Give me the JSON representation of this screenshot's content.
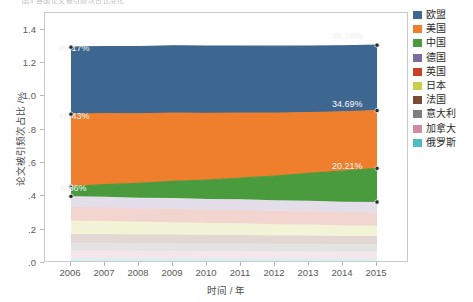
{
  "top_caption": "图3 各国论文被引频次占比变化",
  "axes": {
    "y_title": "论文被引频次占比 /%",
    "x_title": "时间 / 年",
    "y_ticks": [
      ".0",
      ".2",
      ".4",
      ".6",
      ".8",
      "1.0",
      "1.2",
      "1.4"
    ],
    "y_tick_values": [
      0.0,
      0.2,
      0.4,
      0.6,
      0.8,
      1.0,
      1.2,
      1.4
    ],
    "x_ticks": [
      "2006",
      "2007",
      "2008",
      "2009",
      "2010",
      "2011",
      "2012",
      "2013",
      "2014",
      "2015"
    ]
  },
  "legend": {
    "items": [
      {
        "label": "欧盟",
        "color": "#3d6691"
      },
      {
        "label": "美国",
        "color": "#ef7f2c"
      },
      {
        "label": "中国",
        "color": "#4a9b3e"
      },
      {
        "label": "德国",
        "color": "#7e6ba1"
      },
      {
        "label": "英国",
        "color": "#c8422a"
      },
      {
        "label": "日本",
        "color": "#c8cf4a"
      },
      {
        "label": "法国",
        "color": "#7a4a33"
      },
      {
        "label": "意大利",
        "color": "#7f7f7f"
      },
      {
        "label": "加拿大",
        "color": "#cf8ba3"
      },
      {
        "label": "俄罗斯",
        "color": "#4fbcbe"
      }
    ]
  },
  "annotations": [
    {
      "text": "40.17%",
      "series": "欧盟",
      "year": "2006",
      "x_px": 14,
      "y_px": 30
    },
    {
      "text": "39.18%",
      "series": "欧盟",
      "year": "2015",
      "x_px": 287,
      "y_px": 18
    },
    {
      "text": "43.43%",
      "series": "美国",
      "year": "2006",
      "x_px": 14,
      "y_px": 98
    },
    {
      "text": "34.69%",
      "series": "美国",
      "year": "2015",
      "x_px": 287,
      "y_px": 86
    },
    {
      "text": "5.86%",
      "series": "中国",
      "year": "2006",
      "x_px": 16,
      "y_px": 170
    },
    {
      "text": "20.21%",
      "series": "中国",
      "year": "2015",
      "x_px": 287,
      "y_px": 148
    }
  ],
  "chart_data": {
    "type": "area",
    "title": "",
    "xlabel": "时间 / 年",
    "ylabel": "论文被引频次占比 /%",
    "stacked": true,
    "grid": false,
    "legend_position": "right",
    "ylim": [
      0.0,
      1.5
    ],
    "x": [
      2006,
      2007,
      2008,
      2009,
      2010,
      2011,
      2012,
      2013,
      2014,
      2015
    ],
    "categories": [
      "2006",
      "2007",
      "2008",
      "2009",
      "2010",
      "2011",
      "2012",
      "2013",
      "2014",
      "2015"
    ],
    "series": [
      {
        "name": "俄罗斯",
        "color": "#4fbcbe",
        "values": [
          0.03,
          0.03,
          0.029,
          0.029,
          0.028,
          0.028,
          0.027,
          0.027,
          0.026,
          0.026
        ]
      },
      {
        "name": "加拿大",
        "color": "#cf8ba3",
        "values": [
          0.046,
          0.046,
          0.045,
          0.045,
          0.044,
          0.044,
          0.043,
          0.043,
          0.042,
          0.042
        ]
      },
      {
        "name": "意大利",
        "color": "#7f7f7f",
        "values": [
          0.046,
          0.046,
          0.046,
          0.046,
          0.046,
          0.046,
          0.046,
          0.046,
          0.046,
          0.046
        ]
      },
      {
        "name": "法国",
        "color": "#7a4a33",
        "values": [
          0.052,
          0.052,
          0.051,
          0.051,
          0.05,
          0.05,
          0.049,
          0.049,
          0.048,
          0.048
        ]
      },
      {
        "name": "日本",
        "color": "#c8cf4a",
        "values": [
          0.08,
          0.078,
          0.076,
          0.074,
          0.072,
          0.07,
          0.068,
          0.066,
          0.064,
          0.062
        ]
      },
      {
        "name": "英国",
        "color": "#c8422a",
        "values": [
          0.082,
          0.082,
          0.081,
          0.081,
          0.08,
          0.08,
          0.079,
          0.079,
          0.078,
          0.078
        ]
      },
      {
        "name": "德国",
        "color": "#7e6ba1",
        "values": [
          0.064,
          0.064,
          0.064,
          0.064,
          0.064,
          0.064,
          0.064,
          0.064,
          0.064,
          0.064
        ]
      },
      {
        "name": "中国",
        "color": "#4a9b3e",
        "values": [
          0.059,
          0.072,
          0.086,
          0.1,
          0.114,
          0.128,
          0.146,
          0.164,
          0.183,
          0.202
        ]
      },
      {
        "name": "美国",
        "color": "#ef7f2c",
        "values": [
          0.434,
          0.426,
          0.417,
          0.409,
          0.4,
          0.389,
          0.377,
          0.365,
          0.356,
          0.347
        ]
      },
      {
        "name": "欧盟",
        "color": "#3d6691",
        "values": [
          0.402,
          0.403,
          0.404,
          0.404,
          0.404,
          0.403,
          0.402,
          0.399,
          0.396,
          0.392
        ]
      }
    ],
    "point_labels": {
      "欧盟": {
        "2006": "40.17%",
        "2015": "39.18%"
      },
      "美国": {
        "2006": "43.43%",
        "2015": "34.69%"
      },
      "中国": {
        "2006": "5.86%",
        "2015": "20.21%"
      }
    }
  },
  "plot": {
    "width_px": 364,
    "height_px": 250,
    "x_left_px": 26,
    "x_right_px": 332,
    "faded_band_opacity": 0.22
  }
}
